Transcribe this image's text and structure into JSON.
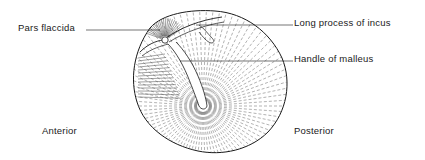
{
  "diagram": {
    "labels": {
      "pars_flaccida": "Pars flaccida",
      "long_process_of_incus": "Long process of incus",
      "handle_of_malleus": "Handle of malleus",
      "anterior": "Anterior",
      "posterior": "Posterior"
    },
    "colors": {
      "ink": "#1a1a1a",
      "hatch": "#555555",
      "background": "#ffffff"
    }
  }
}
